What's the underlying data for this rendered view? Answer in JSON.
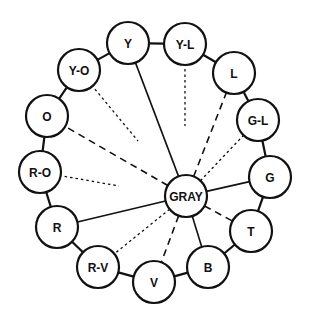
{
  "diagram": {
    "center": {
      "id": "gray",
      "label": "GRAY",
      "x": 186,
      "y": 196
    },
    "radius": 21,
    "nodes": [
      {
        "id": "y",
        "label": "Y",
        "x": 128,
        "y": 43
      },
      {
        "id": "yl",
        "label": "Y-L",
        "x": 185,
        "y": 44
      },
      {
        "id": "l",
        "label": "L",
        "x": 234,
        "y": 73
      },
      {
        "id": "gl",
        "label": "G-L",
        "x": 258,
        "y": 120
      },
      {
        "id": "g",
        "label": "G",
        "x": 270,
        "y": 177
      },
      {
        "id": "t",
        "label": "T",
        "x": 251,
        "y": 231
      },
      {
        "id": "b",
        "label": "B",
        "x": 208,
        "y": 267
      },
      {
        "id": "v",
        "label": "V",
        "x": 154,
        "y": 282
      },
      {
        "id": "rv",
        "label": "R-V",
        "x": 98,
        "y": 267
      },
      {
        "id": "r",
        "label": "R",
        "x": 57,
        "y": 227
      },
      {
        "id": "ro",
        "label": "R-O",
        "x": 40,
        "y": 172
      },
      {
        "id": "o",
        "label": "O",
        "x": 47,
        "y": 116
      },
      {
        "id": "yo",
        "label": "Y-O",
        "x": 79,
        "y": 70
      }
    ],
    "spokes": [
      {
        "to": "y",
        "style": "solid",
        "partial": false
      },
      {
        "to": "yl",
        "style": "dotted",
        "partial": true,
        "end": [
          185,
          126
        ]
      },
      {
        "to": "l",
        "style": "dashed",
        "partial": false
      },
      {
        "to": "gl",
        "style": "dotted",
        "partial": false
      },
      {
        "to": "g",
        "style": "solid",
        "partial": false
      },
      {
        "to": "t",
        "style": "dashed",
        "partial": false
      },
      {
        "to": "b",
        "style": "solid",
        "partial": false
      },
      {
        "to": "v",
        "style": "dashed",
        "partial": false
      },
      {
        "to": "rv",
        "style": "dotted",
        "partial": false
      },
      {
        "to": "r",
        "style": "solid",
        "partial": false
      },
      {
        "to": "ro",
        "style": "dotted",
        "partial": true,
        "end": [
          119,
          186
        ]
      },
      {
        "to": "o",
        "style": "dashed",
        "partial": false
      },
      {
        "to": "yo",
        "style": "dotted",
        "partial": true,
        "end": [
          138,
          141
        ]
      }
    ],
    "colors": {
      "stroke": "#111111",
      "fill": "#ffffff",
      "background": "#ffffff"
    }
  }
}
